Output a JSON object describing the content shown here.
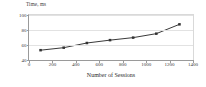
{
  "chart_data": {
    "type": "line",
    "title": "",
    "subtitle": "",
    "xlabel": "Number of Sessions",
    "ylabel": "Time, ms",
    "x": [
      100,
      300,
      500,
      700,
      900,
      1100,
      1300
    ],
    "values": [
      51,
      54.5,
      61,
      65,
      68.5,
      74,
      87
    ],
    "series": [
      {
        "name": "Time, ms",
        "x": [
          100,
          300,
          500,
          700,
          900,
          1100,
          1300
        ],
        "values": [
          51,
          54.5,
          61,
          65,
          68.5,
          74,
          87
        ]
      }
    ],
    "xlim": [
      0,
      1400
    ],
    "ylim": [
      40,
      100
    ],
    "xticks": [
      0,
      200,
      400,
      600,
      800,
      1000,
      1200,
      1400
    ],
    "yticks": [
      40,
      60,
      80,
      100
    ],
    "xtick_labels": [
      "0",
      "200",
      "400",
      "600",
      "800",
      "1000",
      "1200",
      "1400"
    ],
    "ytick_labels": [
      "40",
      "60",
      "80",
      "100"
    ],
    "grid": true,
    "legend": false,
    "legend_position": "none",
    "marker": "square",
    "line_color": "#333333",
    "marker_color": "#333333",
    "axis_color": "#9a9a9a",
    "grid_color": "#e2e2e2",
    "background_color": "#ffffff"
  }
}
